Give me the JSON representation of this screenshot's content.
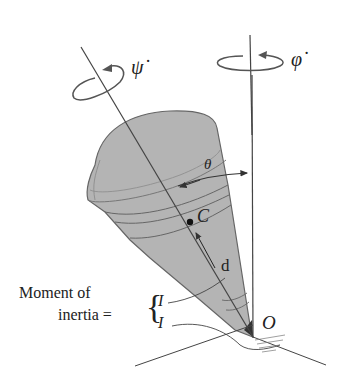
{
  "diagram": {
    "labels": {
      "psi_dot": "ψ̇",
      "phi_dot": "φ̇",
      "theta": "θ",
      "center_of_mass": "C",
      "distance": "d",
      "pivot": "O",
      "moment_line1": "Moment of",
      "moment_line2": "inertia =",
      "I_upper": "I",
      "I_lower": "I"
    },
    "colors": {
      "cone_fill": "#b4b4b4",
      "cone_stroke": "#555555",
      "line": "#444444",
      "background": "#ffffff"
    }
  }
}
